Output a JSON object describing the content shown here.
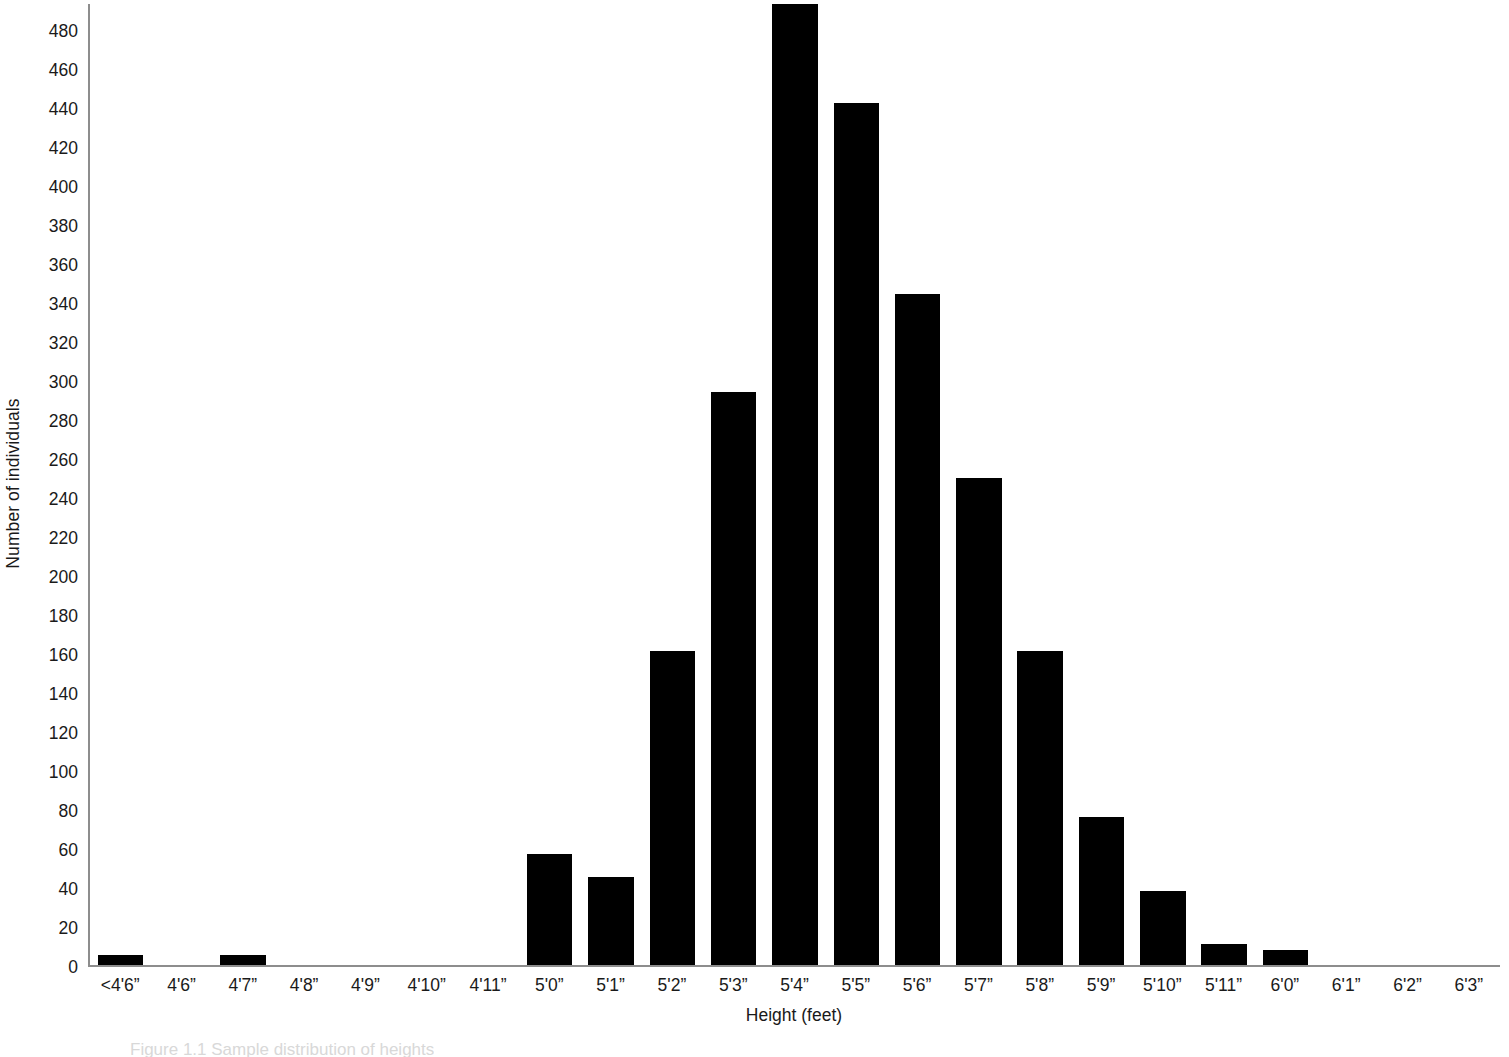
{
  "chart_data": {
    "type": "bar",
    "title": "",
    "xlabel": "Height (feet)",
    "ylabel": "Number of individuals",
    "grid": false,
    "legend": null,
    "ylim": [
      0,
      493
    ],
    "ytick_step": 20,
    "ytick_labels": [
      "480",
      "460",
      "440",
      "420",
      "400",
      "380",
      "360",
      "340",
      "320",
      "300",
      "280",
      "260",
      "240",
      "220",
      "200",
      "180",
      "160",
      "140",
      "120",
      "100",
      "80",
      "60",
      "40",
      "20",
      "0"
    ],
    "categories": [
      "<4'6”",
      "4'6”",
      "4'7”",
      "4'8”",
      "4'9”",
      "4'10”",
      "4'11”",
      "5'0”",
      "5'1”",
      "5'2”",
      "5'3”",
      "5'4”",
      "5'5”",
      "5'6”",
      "5'7”",
      "5'8”",
      "5'9”",
      "5'10”",
      "5'11”",
      "6'0”",
      "6'1”",
      "6'2”",
      "6'3”"
    ],
    "values": [
      5,
      0,
      5,
      0,
      0,
      0,
      0,
      57,
      45,
      161,
      294,
      493,
      442,
      344,
      250,
      161,
      76,
      38,
      11,
      8,
      0,
      0,
      0
    ],
    "bar_color": "#000000",
    "axis_color": "#8d8d8d",
    "text_color": "#1a1a1a",
    "background": "#ffffff"
  },
  "caption": {
    "text": "Figure 1.1   Sample distribution of heights"
  }
}
